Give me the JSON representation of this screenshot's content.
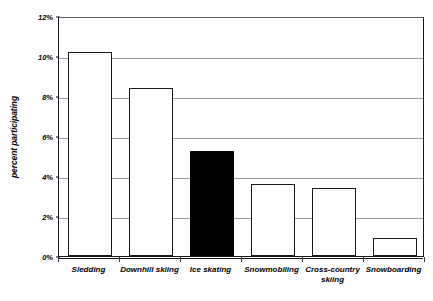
{
  "chart_data": {
    "type": "bar",
    "title": "",
    "xlabel": "",
    "ylabel": "percent participating",
    "categories": [
      "Sledding",
      "Downhill skiing",
      "Ice skating",
      "Snowmobiling",
      "Cross-country\nskiing",
      "Snowboarding"
    ],
    "values": [
      10.2,
      8.4,
      5.25,
      3.6,
      3.4,
      0.9
    ],
    "values_formatted": [
      "10.2%",
      "8.4%",
      "5.3%",
      "3.6%",
      "3.4%",
      "0.9%"
    ],
    "highlighted_index": 2,
    "highlight_color": "#000000",
    "bar_fill_color": "#ffffff",
    "bar_edge_color": "#1a1a1a",
    "gridline_color": "#9a9a9a",
    "grid": true,
    "legend": "none",
    "ylim": [
      0,
      12
    ],
    "ytick_values": [
      0,
      2,
      4,
      6,
      8,
      10,
      12
    ],
    "ytick_labels": [
      "0%",
      "2%",
      "4%",
      "6%",
      "8%",
      "10%",
      "12%"
    ],
    "series": [
      {
        "name": "percent participating",
        "values": [
          10.2,
          8.4,
          5.25,
          3.6,
          3.4,
          0.9
        ]
      }
    ]
  },
  "title_fragment": "",
  "axis": {
    "y_title": "percent participating"
  }
}
